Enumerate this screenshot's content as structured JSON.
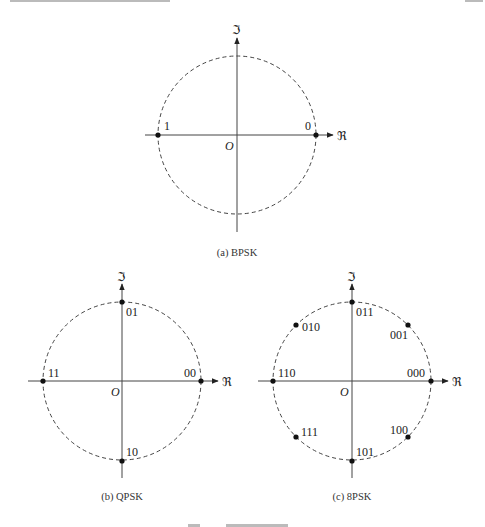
{
  "page": {
    "top_header_fragment": "",
    "figure_caption_fragment": "图 … 调制的星座图"
  },
  "axes": {
    "real_symbol": "ℜ",
    "imag_symbol": "ℑ",
    "origin_label": "O"
  },
  "panels": [
    {
      "id": "a",
      "caption": "(a) BPSK",
      "modulation": "BPSK",
      "points": [
        {
          "label": "0",
          "angle_deg": 0
        },
        {
          "label": "1",
          "angle_deg": 180
        }
      ]
    },
    {
      "id": "b",
      "caption": "(b) QPSK",
      "modulation": "QPSK",
      "points": [
        {
          "label": "00",
          "angle_deg": 0
        },
        {
          "label": "01",
          "angle_deg": 90
        },
        {
          "label": "11",
          "angle_deg": 180
        },
        {
          "label": "10",
          "angle_deg": 270
        }
      ]
    },
    {
      "id": "c",
      "caption": "(c) 8PSK",
      "modulation": "8PSK",
      "points": [
        {
          "label": "000",
          "angle_deg": 0
        },
        {
          "label": "001",
          "angle_deg": 45
        },
        {
          "label": "011",
          "angle_deg": 90
        },
        {
          "label": "010",
          "angle_deg": 135
        },
        {
          "label": "110",
          "angle_deg": 180
        },
        {
          "label": "111",
          "angle_deg": 225
        },
        {
          "label": "101",
          "angle_deg": 270
        },
        {
          "label": "100",
          "angle_deg": 315
        }
      ]
    }
  ]
}
